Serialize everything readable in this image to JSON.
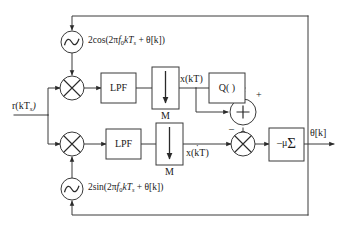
{
  "figure": {
    "background_color": "#ffffff",
    "line_color": "#3a3a3a",
    "text_color": "#1a1a1a"
  },
  "signals": {
    "input_label": "r(kT",
    "input_label_sub": "s",
    "input_label_close": ")",
    "upper_branch_label": "x(kT)",
    "lower_branch_label_base": "x(kT)",
    "lower_branch_dot": "˙",
    "output_label": "θ[k]"
  },
  "oscillators": [
    {
      "id": "cos-oscillator",
      "icon": "sine-wave-source-icon",
      "expression_prefix": "2cos(2π",
      "expression_f": "f",
      "expression_f_sub": "0",
      "expression_mid": "kT",
      "expression_mid_sub": "s",
      "expression_suffix": " + θ[k])"
    },
    {
      "id": "sin-oscillator",
      "icon": "sine-wave-source-icon",
      "expression_prefix": "2sin(2π",
      "expression_f": "f",
      "expression_f_sub": "0",
      "expression_mid": "kT",
      "expression_mid_sub": "s",
      "expression_suffix": " + θ[k])"
    }
  ],
  "blocks": {
    "lpf_upper": {
      "label": "LPF"
    },
    "lpf_lower": {
      "label": "LPF"
    },
    "decimator_upper": {
      "label": "M",
      "icon": "down-arrow-icon"
    },
    "decimator_lower": {
      "label": "M",
      "icon": "down-arrow-icon"
    },
    "quantizer": {
      "label": "Q( )"
    },
    "accumulator": {
      "label_mu": "–μ",
      "label_sigma": "Σ"
    }
  },
  "operators": {
    "mixer_upper": {
      "symbol": "multiply-circle-icon"
    },
    "mixer_lower": {
      "symbol": "multiply-circle-icon"
    },
    "mixer_error": {
      "symbol": "multiply-circle-icon"
    },
    "adder": {
      "symbol": "plus-circle-icon",
      "sign_positive": "+",
      "sign_negative": "–"
    }
  }
}
